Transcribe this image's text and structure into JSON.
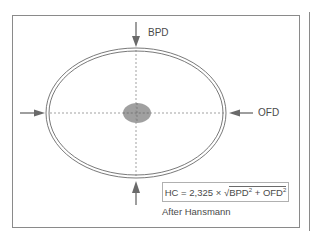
{
  "figure": {
    "labels": {
      "bpd": "BPD",
      "ofd": "OFD"
    },
    "formula": {
      "lhs": "HC",
      "equals": "=",
      "coefficient": "2,325",
      "times": "×",
      "sqrt_symbol": "√",
      "term1": "BPD",
      "plus": "+",
      "term2": "OFD",
      "exponent": "2",
      "full_text": "HC = 2,325 × √ BPD² + OFD²"
    },
    "attribution": "After Hansmann",
    "elements": {
      "skull_outline": "double ellipse",
      "center_marker": "gray ellipse (midline structure)",
      "axes": "dashed crosshair lines",
      "arrows": [
        "top (down)",
        "bottom (up)",
        "left (right)",
        "right (left)"
      ]
    },
    "colors": {
      "lines": "#6a6a6a",
      "center_marker": "#8f8f8f",
      "frame": "#8a8a8a",
      "text": "#4a4a4a"
    }
  }
}
